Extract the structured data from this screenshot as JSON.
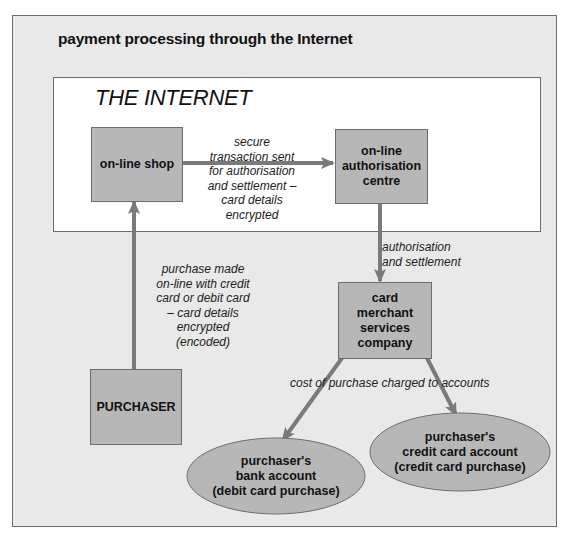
{
  "diagram": {
    "title": "payment processing through the Internet",
    "internet_label": "THE INTERNET",
    "nodes": {
      "online_shop": "on-line shop",
      "auth_centre": "on-line\nauthorisation\ncentre",
      "purchaser": "PURCHASER",
      "card_merchant": "card\nmerchant\nservices\ncompany",
      "bank_account": "purchaser's\nbank account\n(debit card purchase)",
      "credit_account": "purchaser's\ncredit card account\n(credit card purchase)"
    },
    "edges": {
      "shop_to_auth": "secure\ntransaction sent\nfor authorisation\nand settlement –\ncard details\nencrypted",
      "purchaser_to_shop": "purchase made\non-line with credit\ncard or debit card\n– card details\nencrypted\n(encoded)",
      "auth_to_merchant": "authorisation\nand settlement",
      "merchant_to_accounts": "cost of purchase charged to accounts"
    },
    "colors": {
      "background": "#e9e9e9",
      "internet_box": "#ffffff",
      "node_fill": "#b7b7b7",
      "arrow": "#7a7a7a",
      "border": "#6d6d6d"
    }
  }
}
